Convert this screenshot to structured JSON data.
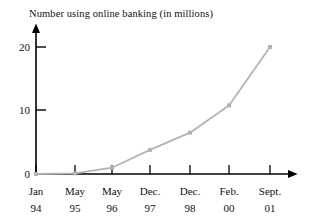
{
  "chart_data": {
    "type": "line",
    "title": "Number using online banking (in millions)",
    "xlabel": "",
    "ylabel": "",
    "categories": [
      "Jan 94",
      "May 95",
      "May 96",
      "Dec. 97",
      "Dec. 98",
      "Feb. 00",
      "Sept. 01"
    ],
    "category_lines": [
      {
        "top": "Jan",
        "bottom": "94"
      },
      {
        "top": "May",
        "bottom": "95"
      },
      {
        "top": "May",
        "bottom": "96"
      },
      {
        "top": "Dec.",
        "bottom": "97"
      },
      {
        "top": "Dec.",
        "bottom": "98"
      },
      {
        "top": "Feb.",
        "bottom": "00"
      },
      {
        "top": "Sept.",
        "bottom": "01"
      }
    ],
    "values": [
      0,
      0.1,
      1,
      3.8,
      6.5,
      10.8,
      20
    ],
    "ylim": [
      0,
      22
    ],
    "ytick_labels": [
      "0",
      "10",
      "20"
    ],
    "ytick_values": [
      0,
      10,
      20
    ],
    "grid": false,
    "legend": null,
    "series_color": "#b3b3b3",
    "axis_color": "#000000",
    "marker": "square"
  }
}
